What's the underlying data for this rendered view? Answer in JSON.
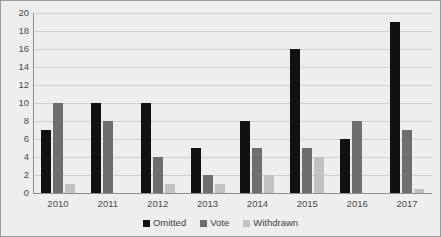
{
  "chart_data": {
    "type": "bar",
    "title": "",
    "subtitle": "",
    "xlabel": "",
    "ylabel": "",
    "categories": [
      "2010",
      "2011",
      "2012",
      "2013",
      "2014",
      "2015",
      "2016",
      "2017"
    ],
    "series": [
      {
        "name": "Omitted",
        "color": "#111111",
        "values": [
          7,
          10,
          10,
          5,
          8,
          16,
          6,
          19
        ]
      },
      {
        "name": "Vote",
        "color": "#6e6e6e",
        "values": [
          10,
          8,
          4,
          2,
          5,
          5,
          8,
          7
        ]
      },
      {
        "name": "Withdrawn",
        "color": "#c2c2c2",
        "values": [
          1,
          0,
          1,
          1,
          2,
          4,
          0,
          0.5
        ]
      }
    ],
    "ylim": [
      0,
      20
    ],
    "ytick_step": 2,
    "yticks": [
      "20",
      "18",
      "16",
      "14",
      "12",
      "10",
      "8",
      "6",
      "4",
      "2",
      "0"
    ],
    "grid": true,
    "grid_axis": "y",
    "legend_position": "bottom",
    "background_color": "#eeeeee",
    "gridline_color": "#d2d2d2",
    "axis_color": "#8f8f8f"
  },
  "legend": {
    "items": [
      {
        "label": "Omitted"
      },
      {
        "label": "Vote"
      },
      {
        "label": "Withdrawn"
      }
    ]
  }
}
